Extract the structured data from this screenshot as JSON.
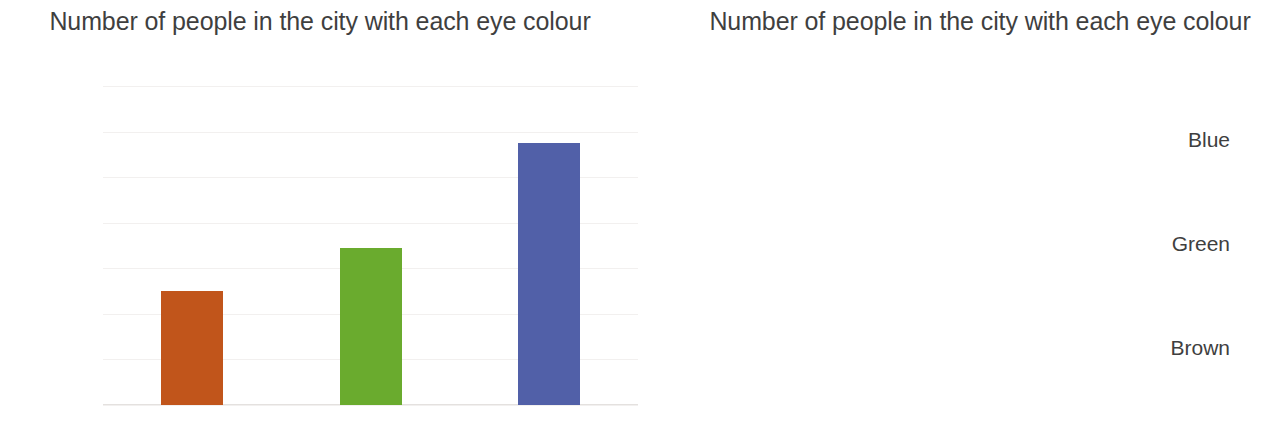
{
  "charts": {
    "left": {
      "title": "Number of people in the city with each eye colour",
      "y_ticks": [
        "0",
        "100,000",
        "200,000",
        "300,000",
        "400,000",
        "500,000",
        "600,000",
        "700,000"
      ],
      "categories": [
        "Brown",
        "Green",
        "Blue"
      ]
    },
    "right": {
      "title": "Number of people in the city with each eye colour",
      "x_ticks": [
        "0",
        "100,000",
        "200,000",
        "300,000",
        "400,000",
        "500,000",
        "600,000",
        "700,000"
      ],
      "categories": [
        "Brown",
        "Green",
        "Blue"
      ]
    }
  },
  "colors": {
    "brown": "#C1551B",
    "green": "#6AAB2E",
    "blue": "#5160A8",
    "gridline": "#f2f0ef",
    "axis": "#e4e1df",
    "text": "#3f3f3f",
    "background": "#ffffff"
  },
  "chart_data": [
    {
      "type": "bar",
      "orientation": "vertical",
      "title": "Number of people in the city with each eye colour",
      "xlabel": "",
      "ylabel": "",
      "categories": [
        "Brown",
        "Green",
        "Blue"
      ],
      "values": [
        250000,
        345000,
        575000
      ],
      "colors": [
        "#C1551B",
        "#6AAB2E",
        "#5160A8"
      ],
      "ylim": [
        0,
        700000
      ],
      "yticks": [
        0,
        100000,
        200000,
        300000,
        400000,
        500000,
        600000,
        700000
      ],
      "ytick_labels": [
        "0",
        "100,000",
        "200,000",
        "300,000",
        "400,000",
        "500,000",
        "600,000",
        "700,000"
      ],
      "grid": "horizontal",
      "legend": "none"
    },
    {
      "type": "bar",
      "orientation": "horizontal",
      "title": "Number of people in the city with each eye colour",
      "xlabel": "",
      "ylabel": "",
      "categories": [
        "Brown",
        "Green",
        "Blue"
      ],
      "values": [
        250000,
        345000,
        575000
      ],
      "colors": [
        "#C1551B",
        "#6AAB2E",
        "#5160A8"
      ],
      "xlim": [
        0,
        700000
      ],
      "xticks": [
        0,
        100000,
        200000,
        300000,
        400000,
        500000,
        600000,
        700000
      ],
      "xtick_labels": [
        "0",
        "100,000",
        "200,000",
        "300,000",
        "400,000",
        "500,000",
        "600,000",
        "700,000"
      ],
      "grid": "vertical",
      "legend": "none"
    }
  ]
}
